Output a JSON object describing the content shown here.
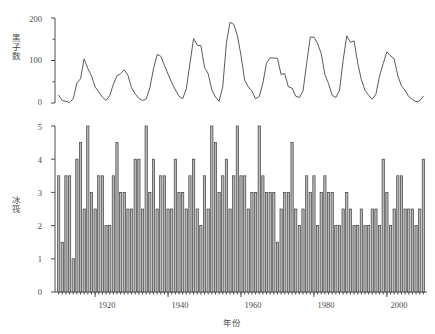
{
  "figure": {
    "panels": [
      "sunspot-line-panel",
      "icerafting-bar-panel"
    ],
    "x_axis_label": "年份",
    "x_ticks": [
      1920,
      1940,
      1960,
      1980,
      2000
    ],
    "x_range": [
      1909,
      2011
    ],
    "line_color": "#5a5a5a",
    "bar_fill_color": "#b9b9b9",
    "bar_edge_color": "#3f3f3f",
    "axis_color": "#4d4d4d"
  },
  "chart_data": [
    {
      "type": "line",
      "name": "sunspot-line-panel",
      "title": "",
      "xlabel": "年份",
      "ylabel": "黑子数",
      "xlim": [
        1909,
        2011
      ],
      "ylim": [
        0,
        200
      ],
      "yticks": [
        0,
        100,
        200
      ],
      "yticks_minor": [
        50,
        150
      ],
      "xticks": [
        1920,
        1940,
        1960,
        1980,
        2000
      ],
      "grid": false,
      "legend": "none",
      "x": [
        1910,
        1911,
        1912,
        1913,
        1914,
        1915,
        1916,
        1917,
        1918,
        1919,
        1920,
        1921,
        1922,
        1923,
        1924,
        1925,
        1926,
        1927,
        1928,
        1929,
        1930,
        1931,
        1932,
        1933,
        1934,
        1935,
        1936,
        1937,
        1938,
        1939,
        1940,
        1941,
        1942,
        1943,
        1944,
        1945,
        1946,
        1947,
        1948,
        1949,
        1950,
        1951,
        1952,
        1953,
        1954,
        1955,
        1956,
        1957,
        1958,
        1959,
        1960,
        1961,
        1962,
        1963,
        1964,
        1965,
        1966,
        1967,
        1968,
        1969,
        1970,
        1971,
        1972,
        1973,
        1974,
        1975,
        1976,
        1977,
        1978,
        1979,
        1980,
        1981,
        1982,
        1983,
        1984,
        1985,
        1986,
        1987,
        1988,
        1989,
        1990,
        1991,
        1992,
        1993,
        1994,
        1995,
        1996,
        1997,
        1998,
        1999,
        2000,
        2001,
        2002,
        2003,
        2004,
        2005,
        2006,
        2007,
        2008,
        2009,
        2010
      ],
      "y": [
        18,
        6,
        4,
        1,
        10,
        47,
        57,
        104,
        81,
        64,
        38,
        26,
        14,
        6,
        17,
        44,
        64,
        69,
        78,
        65,
        36,
        21,
        11,
        6,
        9,
        36,
        80,
        114,
        110,
        89,
        68,
        48,
        31,
        16,
        10,
        33,
        93,
        152,
        136,
        135,
        84,
        69,
        31,
        14,
        4,
        38,
        142,
        190,
        185,
        159,
        112,
        54,
        38,
        28,
        10,
        15,
        47,
        94,
        106,
        106,
        105,
        67,
        69,
        38,
        35,
        16,
        13,
        28,
        93,
        155,
        155,
        140,
        116,
        67,
        46,
        18,
        13,
        29,
        100,
        158,
        143,
        146,
        94,
        55,
        30,
        18,
        9,
        21,
        64,
        93,
        120,
        111,
        104,
        64,
        40,
        30,
        15,
        8,
        3,
        5,
        16
      ]
    },
    {
      "type": "bar",
      "name": "icerafting-bar-panel",
      "title": "",
      "xlabel": "年份",
      "ylabel": "冰筏",
      "xlim": [
        1909,
        2011
      ],
      "ylim": [
        0,
        5
      ],
      "yticks": [
        0,
        1,
        2,
        3,
        4,
        5
      ],
      "xticks": [
        1920,
        1940,
        1960,
        1980,
        2000
      ],
      "grid": false,
      "legend": "none",
      "categories": [
        1910,
        1911,
        1912,
        1913,
        1914,
        1915,
        1916,
        1917,
        1918,
        1919,
        1920,
        1921,
        1922,
        1923,
        1924,
        1925,
        1926,
        1927,
        1928,
        1929,
        1930,
        1931,
        1932,
        1933,
        1934,
        1935,
        1936,
        1937,
        1938,
        1939,
        1940,
        1941,
        1942,
        1943,
        1944,
        1945,
        1946,
        1947,
        1948,
        1949,
        1950,
        1951,
        1952,
        1953,
        1954,
        1955,
        1956,
        1957,
        1958,
        1959,
        1960,
        1961,
        1962,
        1963,
        1964,
        1965,
        1966,
        1967,
        1968,
        1969,
        1970,
        1971,
        1972,
        1973,
        1974,
        1975,
        1976,
        1977,
        1978,
        1979,
        1980,
        1981,
        1982,
        1983,
        1984,
        1985,
        1986,
        1987,
        1988,
        1989,
        1990,
        1991,
        1992,
        1993,
        1994,
        1995,
        1996,
        1997,
        1998,
        1999,
        2000,
        2001,
        2002,
        2003,
        2004,
        2005,
        2006,
        2007,
        2008,
        2009,
        2010
      ],
      "values": [
        3.5,
        1.5,
        3.5,
        3.5,
        1.0,
        4.0,
        4.5,
        2.5,
        5.0,
        3.0,
        2.5,
        3.5,
        3.5,
        2.0,
        2.0,
        3.5,
        4.5,
        3.0,
        3.0,
        2.5,
        2.5,
        4.0,
        4.0,
        2.5,
        5.0,
        3.0,
        4.0,
        2.5,
        3.5,
        3.5,
        2.5,
        2.5,
        4.0,
        3.0,
        3.0,
        2.5,
        3.5,
        4.0,
        2.5,
        2.0,
        3.5,
        2.5,
        5.0,
        4.5,
        3.0,
        3.5,
        4.0,
        2.5,
        3.5,
        5.0,
        3.5,
        3.5,
        2.5,
        3.0,
        3.0,
        5.0,
        3.5,
        3.0,
        3.0,
        3.0,
        1.5,
        2.5,
        3.0,
        3.0,
        4.5,
        2.5,
        2.0,
        2.5,
        3.5,
        3.0,
        3.5,
        2.0,
        3.0,
        3.5,
        3.0,
        3.0,
        2.0,
        2.0,
        2.5,
        3.0,
        2.5,
        2.0,
        2.0,
        2.5,
        2.0,
        2.0,
        2.5,
        2.5,
        2.0,
        4.0,
        3.0,
        2.0,
        2.5,
        3.5,
        3.5,
        2.5,
        2.5,
        2.5,
        2.0,
        2.5,
        4.0
      ]
    }
  ]
}
